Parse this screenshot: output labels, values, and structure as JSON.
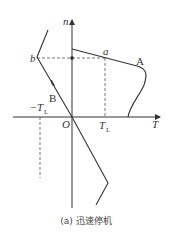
{
  "diagram": {
    "axes": {
      "y_label": "n",
      "x_label": "T",
      "origin_label": "O"
    },
    "ticks": {
      "positive_load_torque": {
        "main": "T",
        "sub": "L"
      },
      "negative_load_torque": {
        "prefix": "−",
        "main": "T",
        "sub": "L"
      }
    },
    "points": {
      "a": "a",
      "b": "b"
    },
    "curves": {
      "A": "A",
      "B": "B"
    },
    "caption": "(a) 迅速停机",
    "colors": {
      "line": "#333333",
      "dashed": "#555555"
    }
  }
}
